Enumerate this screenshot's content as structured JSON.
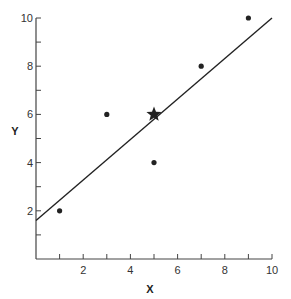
{
  "chart_data": {
    "type": "scatter",
    "title": "",
    "xlabel": "X",
    "ylabel": "Y",
    "xlim": [
      0,
      10
    ],
    "ylim": [
      0,
      10
    ],
    "grid": false,
    "x_ticks": [
      1,
      2,
      3,
      4,
      5,
      6,
      7,
      8,
      9,
      10
    ],
    "x_tick_labels": [
      "2",
      "4",
      "6",
      "8",
      "10"
    ],
    "x_tick_label_values": [
      2,
      4,
      6,
      8,
      10
    ],
    "y_ticks": [
      1,
      2,
      3,
      4,
      5,
      6,
      7,
      8,
      9,
      10
    ],
    "y_tick_labels": [
      "2",
      "4",
      "6",
      "8",
      "10"
    ],
    "y_tick_label_values": [
      2,
      4,
      6,
      8,
      10
    ],
    "series": [
      {
        "name": "observations",
        "marker": "dot",
        "points": [
          {
            "x": 1,
            "y": 2
          },
          {
            "x": 3,
            "y": 6
          },
          {
            "x": 5,
            "y": 4
          },
          {
            "x": 7,
            "y": 8
          },
          {
            "x": 9,
            "y": 10
          }
        ]
      },
      {
        "name": "mean",
        "marker": "star",
        "points": [
          {
            "x": 5,
            "y": 6
          }
        ]
      }
    ],
    "fit_line": {
      "x1": 0,
      "y1": 1.6,
      "x2": 10,
      "y2": 10.0
    }
  },
  "colors": {
    "ink": "#222222",
    "axis": "#444444"
  }
}
